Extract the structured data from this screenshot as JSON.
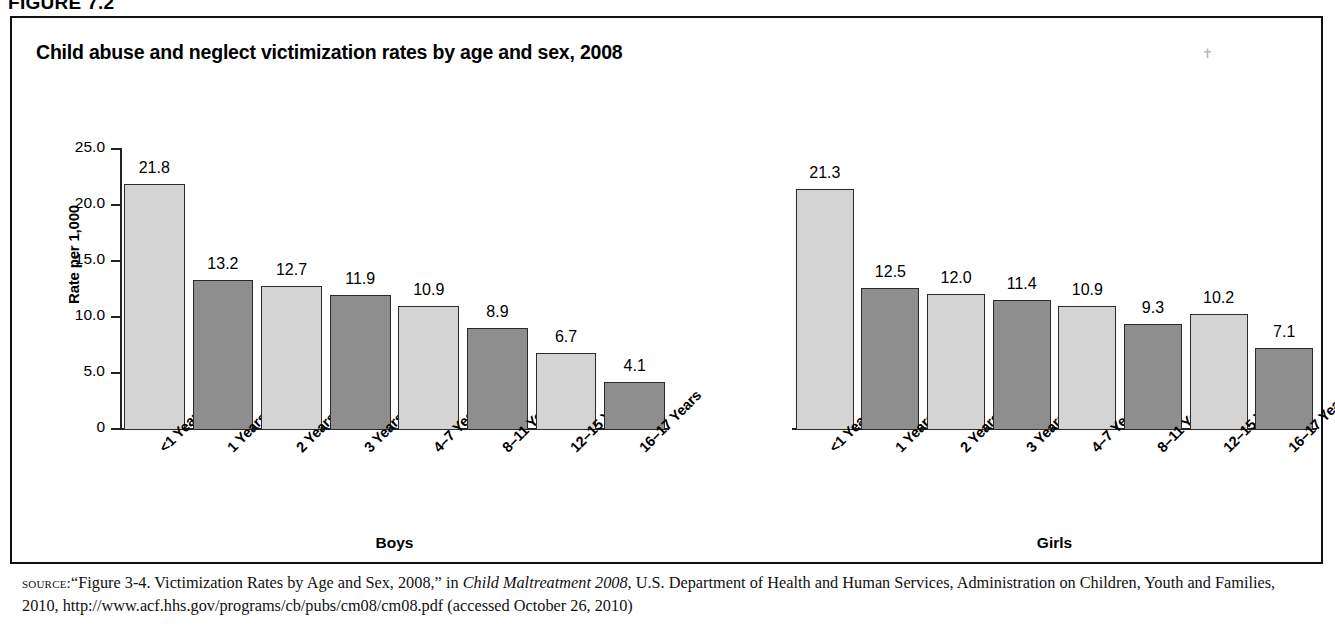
{
  "figure": {
    "number_label": "FIGURE 7.2",
    "title": "Child abuse and neglect victimization rates by age and sex, 2008"
  },
  "source": {
    "kicker": "source:",
    "part1": "“Figure 3-4. Victimization Rates by Age and Sex, 2008,” in ",
    "italic1": "Child Maltreatment 2008",
    "part2": ", U.S. Department of Health and Human Services, Administration on Children, Youth and Families, 2010, http://www.acf.hhs.gov/programs/cb/pubs/cm08/cm08.pdf (accessed October 26, 2010)"
  },
  "chart_data": {
    "type": "bar",
    "title": "Child abuse and neglect victimization rates by age and sex, 2008",
    "xlabel": "",
    "ylabel": "Rate per 1,000",
    "ylim": [
      0,
      25
    ],
    "grid": false,
    "legend_position": "none",
    "ytick_labels": [
      "25.0",
      "20.0",
      "15.0",
      "10.0",
      "5.0",
      "0"
    ],
    "ytick_values": [
      25.0,
      20.0,
      15.0,
      10.0,
      5.0,
      0
    ],
    "categories": [
      "<1 Years",
      "1 Years",
      "2 Years",
      "3 Years",
      "4–7 Years",
      "8–11 Years",
      "12–15 Years",
      "16–17 Years"
    ],
    "panels": [
      {
        "name": "Boys",
        "label": "Boys",
        "values": [
          21.8,
          13.2,
          12.7,
          11.9,
          10.9,
          8.9,
          6.7,
          4.1
        ],
        "value_labels": [
          "21.8",
          "13.2",
          "12.7",
          "11.9",
          "10.9",
          "8.9",
          "6.7",
          "4.1"
        ]
      },
      {
        "name": "Girls",
        "label": "Girls",
        "values": [
          21.3,
          12.5,
          12.0,
          11.4,
          10.9,
          9.3,
          10.2,
          7.1
        ],
        "value_labels": [
          "21.3",
          "12.5",
          "12.0",
          "11.4",
          "10.9",
          "9.3",
          "10.2",
          "7.1"
        ]
      }
    ],
    "colors": {
      "bar_light": "#d4d4d4",
      "bar_dark": "#8e8e8e",
      "bar_border": "#2a2a2a",
      "axis": "#222222",
      "frame": "#111111"
    }
  }
}
